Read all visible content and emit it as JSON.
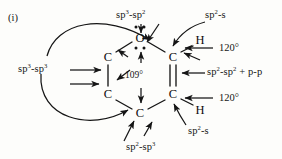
{
  "figure": {
    "index_label": "(i)",
    "caption_present": false
  },
  "molecule": {
    "description": "Six-membered ring with one oxygen and five carbons, showing orbital hybridization of each bond",
    "atoms": [
      {
        "id": "O1",
        "symbol": "O",
        "x": 140,
        "y": 38,
        "lone_pairs": 2
      },
      {
        "id": "C2",
        "symbol": "C",
        "x": 108,
        "y": 57,
        "lone_pairs": 0
      },
      {
        "id": "C3",
        "symbol": "C",
        "x": 108,
        "y": 94,
        "lone_pairs": 0
      },
      {
        "id": "C4",
        "symbol": "C",
        "x": 140,
        "y": 113,
        "lone_pairs": 0
      },
      {
        "id": "C5",
        "symbol": "C",
        "x": 173,
        "y": 94,
        "lone_pairs": 0
      },
      {
        "id": "C6",
        "symbol": "C",
        "x": 173,
        "y": 57,
        "lone_pairs": 0
      },
      {
        "id": "H1",
        "symbol": "H",
        "x": 200,
        "y": 44,
        "lone_pairs": 0
      },
      {
        "id": "H2",
        "symbol": "H",
        "x": 200,
        "y": 108,
        "lone_pairs": 0
      }
    ],
    "bonds": [
      {
        "from": "O1",
        "to": "C2",
        "order": 1
      },
      {
        "from": "O1",
        "to": "C6",
        "order": 1
      },
      {
        "from": "C2",
        "to": "C3",
        "order": 1
      },
      {
        "from": "C3",
        "to": "C4",
        "order": 1
      },
      {
        "from": "C4",
        "to": "C5",
        "order": 1
      },
      {
        "from": "C5",
        "to": "C6",
        "order": 2
      },
      {
        "from": "C6",
        "to": "H1",
        "order": 1
      },
      {
        "from": "C5",
        "to": "H2",
        "order": 1
      }
    ]
  },
  "annotations": {
    "sp3_sp3": "sp3-sp3",
    "sp3_sp2": "sp3-sp2",
    "sp2_s_top": "sp2-s",
    "sp2_s_bottom": "sp2-s",
    "sp2_sp3": "sp2-sp3",
    "sp2_sp2_p_p": "sp2-sp2 + p-p",
    "angle_109": "109°",
    "angle_120_top": "120°",
    "angle_120_bottom": "120°"
  },
  "label_parts": {
    "sp3_sp3": {
      "base1": "sp",
      "sup1": "3",
      "sep": "-",
      "base2": "sp",
      "sup2": "3"
    },
    "sp3_sp2": {
      "base1": "sp",
      "sup1": "3",
      "sep": "-",
      "base2": "sp",
      "sup2": "2"
    },
    "sp2_s_top": {
      "base1": "sp",
      "sup1": "2",
      "sep": "-s"
    },
    "sp2_s_bottom": {
      "base1": "sp",
      "sup1": "2",
      "sep": "-s"
    },
    "sp2_sp3": {
      "base1": "sp",
      "sup1": "2",
      "sep": "-",
      "base2": "sp",
      "sup2": "3"
    },
    "sp2_sp2_p_p": {
      "base1": "sp",
      "sup1": "2",
      "sep": "-",
      "base2": "sp",
      "sup2": "2",
      "tail": " + p-p"
    }
  },
  "style": {
    "ink": "#151515",
    "paper": "#fdfdfb",
    "stroke_width": 1.3
  }
}
